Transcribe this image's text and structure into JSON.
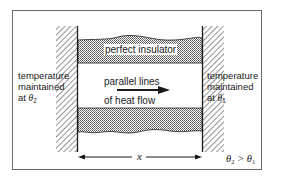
{
  "diagram": {
    "type": "steady-state heat conduction through a bar",
    "labels": {
      "insulator": "perfect insulator",
      "heat_flow_line1": "parallel lines",
      "heat_flow_line2": "of heat flow",
      "left_temp_line1": "temperature",
      "left_temp_line2": "maintained",
      "left_temp_at": "at ",
      "left_theta": "θ",
      "left_theta_sub": "2",
      "right_temp_line1": "temperature",
      "right_temp_line2": "maintained",
      "right_temp_at": "at ",
      "right_theta": "θ",
      "right_theta_sub": "1",
      "length": "x",
      "relation_lhs": "θ",
      "relation_lhs_sub": "2",
      "relation_op": " > ",
      "relation_rhs": "θ",
      "relation_rhs_sub": "1"
    },
    "colors": {
      "line": "#1a1a1a",
      "frame": "#6a6a6a",
      "insulator_fill": "#c9c9c9",
      "hatch": "#3a3a3a"
    }
  }
}
